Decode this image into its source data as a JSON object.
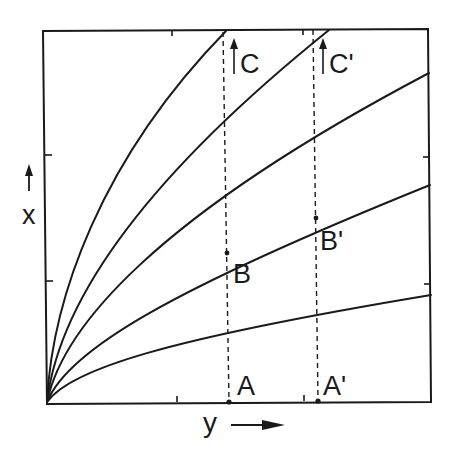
{
  "figure": {
    "axes": {
      "x_label": "x",
      "y_label": "y",
      "x_arrow": "up-arrow",
      "y_arrow": "right-arrow"
    },
    "point_labels": {
      "A": "A",
      "A_prime": "A'",
      "B": "B",
      "B_prime": "B'",
      "C": "C",
      "C_prime": "C'"
    },
    "colors": {
      "ink": "#1a1a1a",
      "background": "#ffffff"
    },
    "curves_count": 5,
    "dashed_verticals": [
      "A-B-C",
      "A'-B'-C'"
    ]
  }
}
